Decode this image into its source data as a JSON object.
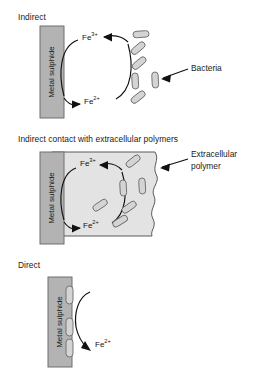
{
  "figure": {
    "background": "#ffffff",
    "panels": [
      {
        "id": "indirect",
        "title": "Indirect",
        "block_label": "Metal sulphide",
        "ion_top": "Fe",
        "ion_top_charge": "3+",
        "ion_bottom": "Fe",
        "ion_bottom_charge": "2+",
        "callout_label": "Bacteria",
        "bacteria_count": 6
      },
      {
        "id": "polymer",
        "title": "Indirect contact with extracellular polymers",
        "block_label": "Metal sulphide",
        "ion_top": "Fe",
        "ion_top_charge": "3+",
        "ion_bottom": "Fe",
        "ion_bottom_charge": "2+",
        "callout_label_line1": "Extracellular",
        "callout_label_line2": "polymer",
        "bacteria_count": 6
      },
      {
        "id": "direct",
        "title": "Direct",
        "block_label": "Metal sulphide",
        "ion_bottom": "Fe",
        "ion_bottom_charge": "2+",
        "bacteria_count": 3
      }
    ]
  },
  "colors": {
    "metal_block_fill": "#b3b3b3",
    "metal_block_stroke": "#6e6e6e",
    "polymer_fill": "#e3e3e3",
    "polymer_stroke": "#5a5a5a",
    "bacteria_fill": "#d4d4d4",
    "bacteria_stroke": "#6a6a6a",
    "arrow_stroke": "#111111",
    "text": "#1a1a1a"
  }
}
